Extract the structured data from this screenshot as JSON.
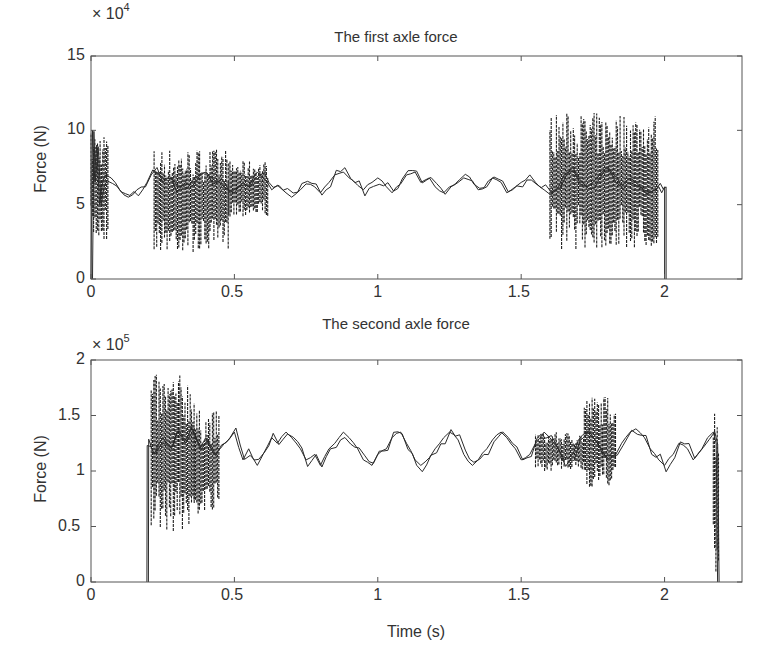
{
  "figure": {
    "xlabel": "Time (s)"
  },
  "chart_data": [
    {
      "type": "line",
      "title": "The first axle force",
      "xlabel": "",
      "ylabel": "Force (N)",
      "y_multiplier_label": "× 10",
      "y_multiplier_exp": "4",
      "xlim": [
        0,
        2.27
      ],
      "ylim": [
        0,
        15
      ],
      "xticks": [
        "0",
        "0.5",
        "1",
        "1.5",
        "2"
      ],
      "xtick_values": [
        0,
        0.5,
        1,
        1.5,
        2
      ],
      "yticks": [
        "0",
        "5",
        "10",
        "15"
      ],
      "ytick_values": [
        0,
        5,
        10,
        15
      ],
      "grid": false,
      "series": [
        {
          "name": "first axle force (x10^4 N)",
          "color": "#222222",
          "x": [
            0.0,
            0.005,
            0.01,
            0.02,
            0.03,
            0.04,
            0.05,
            0.07,
            0.1,
            0.13,
            0.16,
            0.19,
            0.21,
            0.23,
            0.25,
            0.28,
            0.3,
            0.33,
            0.35,
            0.38,
            0.4,
            0.42,
            0.45,
            0.48,
            0.5,
            0.53,
            0.55,
            0.58,
            0.6,
            0.63,
            0.65,
            0.68,
            0.7,
            0.73,
            0.75,
            0.78,
            0.8,
            0.83,
            0.85,
            0.88,
            0.9,
            0.93,
            0.95,
            0.98,
            1.0,
            1.03,
            1.05,
            1.08,
            1.1,
            1.13,
            1.15,
            1.18,
            1.2,
            1.23,
            1.25,
            1.28,
            1.3,
            1.33,
            1.35,
            1.38,
            1.4,
            1.43,
            1.45,
            1.48,
            1.5,
            1.53,
            1.55,
            1.58,
            1.6,
            1.63,
            1.65,
            1.68,
            1.7,
            1.73,
            1.75,
            1.78,
            1.8,
            1.83,
            1.85,
            1.88,
            1.9,
            1.93,
            1.95,
            1.98,
            1.99,
            2.0,
            2.0
          ],
          "y": [
            0,
            10,
            6.5,
            9,
            5,
            6.5,
            7,
            6.8,
            6,
            5.5,
            6,
            6.2,
            7,
            7.5,
            6.5,
            6.8,
            5.8,
            6.5,
            6.2,
            7,
            7.2,
            6.8,
            6.5,
            6,
            5.8,
            6.5,
            6.2,
            7.2,
            6.8,
            6,
            6.3,
            5.8,
            5.5,
            6,
            6.4,
            6.2,
            5.8,
            6.5,
            7,
            7.2,
            6.8,
            6.3,
            6,
            6.5,
            6.8,
            6.2,
            5.8,
            6.4,
            7,
            7.2,
            6.5,
            6.8,
            6.2,
            5.8,
            6.2,
            6.5,
            6.8,
            6.6,
            6,
            6.2,
            6.8,
            6.5,
            5.8,
            6.2,
            6.5,
            7,
            6.5,
            6,
            5.7,
            6.2,
            7,
            7.5,
            6.8,
            6.2,
            6.5,
            7.2,
            7.5,
            6.5,
            6.2,
            6.8,
            6.5,
            6,
            5.8,
            6.2,
            5.8,
            6.2,
            0
          ]
        }
      ],
      "oscillation_bands": [
        {
          "x_start": 0.0,
          "x_end": 0.06,
          "y_min": 2.5,
          "y_max": 10
        },
        {
          "x_start": 0.22,
          "x_end": 0.48,
          "y_min": 1.8,
          "y_max": 8.8
        },
        {
          "x_start": 0.48,
          "x_end": 0.62,
          "y_min": 4.2,
          "y_max": 8.0
        },
        {
          "x_start": 1.6,
          "x_end": 1.98,
          "y_min": 2.0,
          "y_max": 11.2
        }
      ]
    },
    {
      "type": "line",
      "title": "The second axle force",
      "xlabel": "Time (s)",
      "ylabel": "Force (N)",
      "y_multiplier_label": "× 10",
      "y_multiplier_exp": "5",
      "xlim": [
        0,
        2.27
      ],
      "ylim": [
        0,
        2
      ],
      "xticks": [
        "0",
        "0.5",
        "1",
        "1.5",
        "2"
      ],
      "xtick_values": [
        0,
        0.5,
        1,
        1.5,
        2
      ],
      "yticks": [
        "0",
        "0.5",
        "1",
        "1.5",
        "2"
      ],
      "ytick_values": [
        0,
        0.5,
        1,
        1.5,
        2
      ],
      "grid": false,
      "series": [
        {
          "name": "second axle force (x10^5 N)",
          "color": "#222222",
          "x": [
            0.195,
            0.196,
            0.21,
            0.22,
            0.25,
            0.28,
            0.3,
            0.33,
            0.35,
            0.38,
            0.4,
            0.43,
            0.45,
            0.48,
            0.5,
            0.53,
            0.55,
            0.58,
            0.6,
            0.63,
            0.65,
            0.68,
            0.7,
            0.73,
            0.75,
            0.78,
            0.8,
            0.83,
            0.85,
            0.88,
            0.9,
            0.93,
            0.95,
            0.98,
            1.0,
            1.03,
            1.05,
            1.08,
            1.1,
            1.13,
            1.15,
            1.18,
            1.2,
            1.23,
            1.25,
            1.28,
            1.3,
            1.33,
            1.35,
            1.38,
            1.4,
            1.43,
            1.45,
            1.48,
            1.5,
            1.53,
            1.55,
            1.58,
            1.6,
            1.63,
            1.65,
            1.68,
            1.7,
            1.73,
            1.75,
            1.78,
            1.8,
            1.83,
            1.85,
            1.88,
            1.9,
            1.93,
            1.95,
            1.98,
            2.0,
            2.03,
            2.05,
            2.08,
            2.1,
            2.13,
            2.15,
            2.17,
            2.18,
            2.185
          ],
          "y": [
            0,
            1.23,
            1.22,
            1.15,
            1.3,
            1.2,
            1.35,
            1.25,
            1.4,
            1.2,
            1.3,
            1.15,
            1.2,
            1.28,
            1.35,
            1.1,
            1.2,
            1.05,
            1.15,
            1.3,
            1.25,
            1.35,
            1.3,
            1.2,
            1.1,
            1.15,
            1.05,
            1.2,
            1.25,
            1.35,
            1.3,
            1.2,
            1.1,
            1.05,
            1.15,
            1.2,
            1.3,
            1.35,
            1.25,
            1.1,
            1.05,
            1.12,
            1.2,
            1.3,
            1.35,
            1.28,
            1.15,
            1.05,
            1.1,
            1.2,
            1.28,
            1.35,
            1.3,
            1.2,
            1.1,
            1.15,
            1.25,
            1.35,
            1.3,
            1.2,
            1.1,
            1.15,
            1.28,
            1.35,
            1.3,
            1.2,
            1.1,
            1.15,
            1.25,
            1.35,
            1.38,
            1.3,
            1.2,
            1.1,
            1.05,
            1.15,
            1.25,
            1.2,
            1.1,
            1.2,
            1.3,
            1.35,
            1.25,
            0
          ]
        }
      ],
      "oscillation_bands": [
        {
          "x_start": 0.21,
          "x_end": 0.36,
          "y_min": 0.45,
          "y_max": 1.87
        },
        {
          "x_start": 0.36,
          "x_end": 0.45,
          "y_min": 0.6,
          "y_max": 1.55
        },
        {
          "x_start": 1.55,
          "x_end": 1.72,
          "y_min": 1.0,
          "y_max": 1.35
        },
        {
          "x_start": 1.72,
          "x_end": 1.83,
          "y_min": 0.85,
          "y_max": 1.68
        },
        {
          "x_start": 2.17,
          "x_end": 2.19,
          "y_min": 0.0,
          "y_max": 1.62
        }
      ]
    }
  ]
}
